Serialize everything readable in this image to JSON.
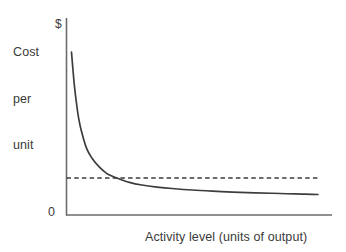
{
  "chart_data": {
    "type": "line",
    "title": "",
    "subtitle": "",
    "ylabel": "Cost per unit",
    "ylabel_lines": [
      "Cost",
      "per",
      "unit"
    ],
    "xlabel": "Activity level (units of output)",
    "y_axis_top_tick": "$",
    "y_axis_origin_tick": "0",
    "grid": false,
    "legend": "none",
    "xlim": [
      0,
      100
    ],
    "ylim": [
      0,
      100
    ],
    "x_tick_labels": [],
    "y_tick_labels": [
      "0",
      "$"
    ],
    "series": [
      {
        "name": "Fixed cost per unit",
        "style": "solid",
        "color": "#3d3d3d",
        "x": [
          2,
          3,
          4,
          5,
          6,
          8,
          10,
          13,
          16,
          20,
          25,
          30,
          36,
          42,
          50,
          58,
          66,
          75,
          85,
          95,
          100
        ],
        "y": [
          88,
          72,
          60,
          51,
          45,
          36,
          31,
          26,
          22.5,
          20,
          17.6,
          16.2,
          15.1,
          14.3,
          13.5,
          12.9,
          12.4,
          12.0,
          11.6,
          11.3,
          11.1
        ]
      },
      {
        "name": "Reference level",
        "style": "dashed",
        "color": "#3d3d3d",
        "x": [
          0,
          100
        ],
        "y": [
          20,
          20
        ]
      }
    ],
    "annotations": [
      {
        "name": "crossing-point",
        "text": "",
        "x": 20,
        "y": 20
      }
    ],
    "colors": {
      "axis": "#6b6b6b",
      "curve": "#3d3d3d",
      "dashed": "#3d3d3d",
      "background": "#ffffff",
      "text": "#3a3a3a"
    }
  }
}
